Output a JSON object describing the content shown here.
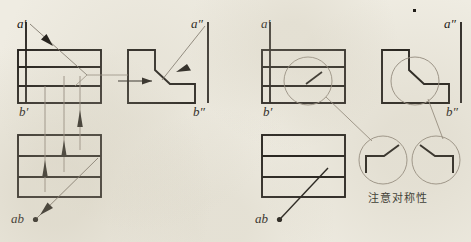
{
  "figure": {
    "title_text": "",
    "background_color": "#efece2",
    "ink_color": "#1a1713",
    "thin_color": "#7c7468",
    "annotation_color": "#241f19"
  },
  "left_panel": {
    "name": "projection-construction-panel",
    "labels": {
      "a_prime": "a′",
      "a_double_prime": "a″",
      "b_prime": "b′",
      "b_double_prime": "b″",
      "ab": "ab"
    },
    "front_view": {
      "name": "front-view",
      "x": 18,
      "y": 50,
      "width": 83,
      "height": 53,
      "h_dividers_y": [
        67,
        86
      ],
      "v_inner_x": 26
    },
    "side_view": {
      "name": "side-view",
      "outline": "L-shaped profile with 45 degree chamfer",
      "x": 128,
      "y": 50,
      "width": 70,
      "height": 53
    },
    "top_view": {
      "name": "top-view",
      "x": 18,
      "y": 135,
      "width": 83,
      "height": 62,
      "h_dividers_y": [
        156,
        177
      ]
    },
    "projection_lines_x": [
      45,
      64,
      80
    ],
    "leader_arrow_label": "chamfer-pointer"
  },
  "right_panel": {
    "name": "detail-callout-panel",
    "labels": {
      "a_prime": "a′",
      "a_double_prime": "a″",
      "b_prime": "b′",
      "b_double_prime": "b″",
      "ab": "ab"
    },
    "front_view": {
      "name": "front-view",
      "x": 262,
      "y": 50,
      "width": 83,
      "height": 53,
      "h_dividers_y": [
        67,
        86
      ],
      "v_inner_x": 270
    },
    "side_view": {
      "name": "side-view",
      "x": 382,
      "y": 50,
      "width": 70,
      "height": 53
    },
    "top_view": {
      "name": "top-view",
      "x": 262,
      "y": 135,
      "width": 83,
      "height": 62,
      "h_dividers_y": [
        156,
        177
      ]
    },
    "callouts": [
      {
        "name": "callout-circle-front",
        "cx": 308,
        "cy": 81,
        "r": 24
      },
      {
        "name": "callout-circle-side",
        "cx": 415,
        "cy": 81,
        "r": 24
      },
      {
        "name": "detail-circle-left",
        "cx": 383,
        "cy": 160,
        "r": 24
      },
      {
        "name": "detail-circle-right",
        "cx": 436,
        "cy": 160,
        "r": 24
      }
    ],
    "note": "注意对称性"
  }
}
